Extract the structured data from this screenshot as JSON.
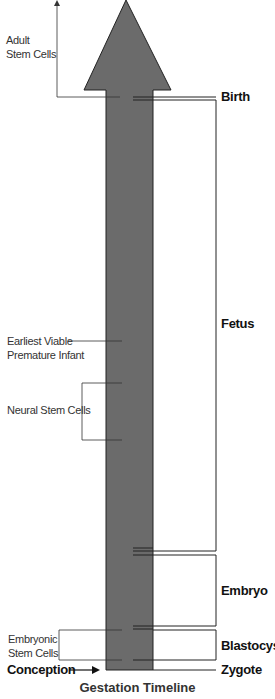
{
  "diagram": {
    "title": "Gestation Timeline",
    "colors": {
      "arrow_fill": "#6b6b6b",
      "arrow_stroke": "#222222",
      "line": "#222222"
    },
    "stages": [
      {
        "id": "birth",
        "label": "Birth"
      },
      {
        "id": "fetus",
        "label": "Fetus"
      },
      {
        "id": "embryo",
        "label": "Embryo"
      },
      {
        "id": "blastocyst",
        "label": "Blastocyst"
      },
      {
        "id": "zygote",
        "label": "Zygote"
      }
    ],
    "annotations": {
      "adult_stem_cells": {
        "line1": "Adult",
        "line2": "Stem Cells"
      },
      "earliest_viable": {
        "line1": "Earliest Viable",
        "line2": "Premature Infant"
      },
      "neural_stem_cells": {
        "label": "Neural Stem Cells"
      },
      "embryonic_stem_cells": {
        "line1": "Embryonic",
        "line2": "Stem Cells"
      },
      "conception": {
        "label": "Conception"
      }
    }
  }
}
